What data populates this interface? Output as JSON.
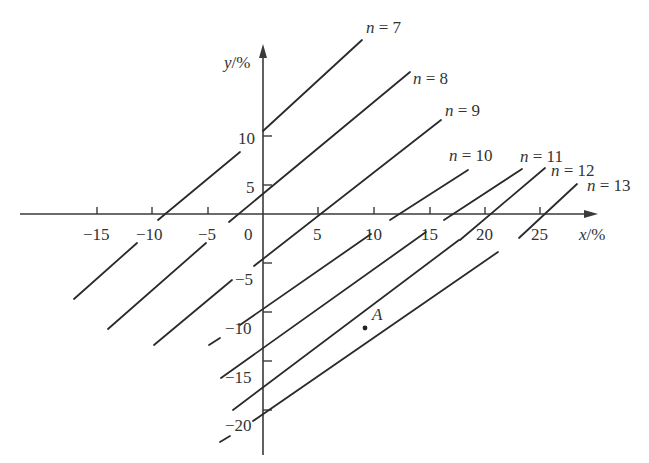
{
  "diagram": {
    "title": "",
    "axes": {
      "x_label_var": "x",
      "x_label_unit": "/%",
      "y_label_var": "y",
      "y_label_unit": "/%",
      "origin_label": "0",
      "x_ticks": [
        "-15",
        "-10",
        "-5",
        "5",
        "10",
        "15",
        "20",
        "25"
      ],
      "y_ticks": [
        "10",
        "5",
        "-5",
        "-10",
        "-15",
        "-20"
      ]
    },
    "lines": [
      {
        "label_var": "n",
        "label_eq": " = 7"
      },
      {
        "label_var": "n",
        "label_eq": " = 8"
      },
      {
        "label_var": "n",
        "label_eq": " = 9"
      },
      {
        "label_var": "n",
        "label_eq": " = 10"
      },
      {
        "label_var": "n",
        "label_eq": " = 11"
      },
      {
        "label_var": "n",
        "label_eq": " = 12"
      },
      {
        "label_var": "n",
        "label_eq": " = 13"
      }
    ],
    "point": {
      "label": "A"
    }
  }
}
